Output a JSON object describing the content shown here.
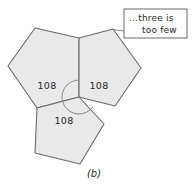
{
  "figure": {
    "caption": "(b)",
    "background_color": "#ffffff",
    "pentagon_fill": "#e9e9e9",
    "pentagon_stroke": "#6b6b6b",
    "angle_labels": [
      {
        "id": "left",
        "text": "108",
        "x": 47,
        "y": 85
      },
      {
        "id": "right",
        "text": "108",
        "x": 99,
        "y": 85
      },
      {
        "id": "bottom",
        "text": "108",
        "x": 64,
        "y": 120
      }
    ],
    "callout": {
      "line1": "...three is",
      "line2": "too few",
      "x": 124,
      "y": 9,
      "width": 63,
      "height": 29
    },
    "pentagons": [
      {
        "id": "upper-left-pentagon",
        "points": "79,38 79,97 37,108 8,66 35,28"
      },
      {
        "id": "upper-right-pentagon",
        "points": "79,38 113,29 141,68 115,106 79,97"
      },
      {
        "id": "bottom-pentagon",
        "points": "79,97 37,108 35,153 80,164 104,124"
      }
    ],
    "gap_arc": {
      "id": "angle-gap-arc",
      "center_x": 79,
      "center_y": 97,
      "radius": 17
    },
    "leader_line": {
      "from_x": 124,
      "from_y": 30,
      "to_x": 113,
      "to_y": 29
    }
  }
}
